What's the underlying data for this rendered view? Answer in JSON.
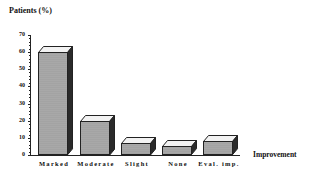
{
  "chart_data": {
    "type": "bar",
    "title": "",
    "ylabel": "Patients (%)",
    "xlabel": "Improvement",
    "categories": [
      "Marked",
      "Moderate",
      "Slight",
      "None",
      "Eval. imp."
    ],
    "values": [
      60,
      20,
      7,
      5,
      8
    ],
    "ylim": [
      0,
      70
    ],
    "yticks": [
      0,
      10,
      20,
      30,
      40,
      50,
      60,
      70
    ],
    "grid": false,
    "legend": null,
    "style": "3d-bar"
  },
  "labels": {
    "y_title": "Patients (%)",
    "x_title": "Improvement",
    "yticks": [
      "0",
      "10",
      "20",
      "30",
      "40",
      "50",
      "60",
      "70"
    ],
    "categories": [
      "Marked",
      "Moderate",
      "Slight",
      "None",
      "Eval.  imp."
    ]
  },
  "colors": {
    "bar_front": "#a8a8a8",
    "bar_top": "#f2f2f2",
    "bar_side": "#2a2a2a",
    "axis": "#222222"
  }
}
